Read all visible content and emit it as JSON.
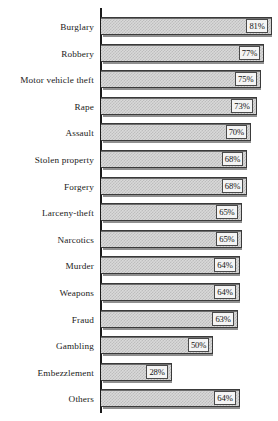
{
  "chart_data": {
    "type": "bar",
    "orientation": "horizontal",
    "title": "",
    "subtitle": "",
    "xlabel": "",
    "ylabel": "",
    "grid": false,
    "legend": null,
    "value_suffix": "%",
    "axis_visible": true,
    "xlim": [
      0,
      100
    ],
    "categories": [
      "Burglary",
      "Robbery",
      "Motor vehicle theft",
      "Rape",
      "Assault",
      "Stolen property",
      "Forgery",
      "Larceny-theft",
      "Narcotics",
      "Murder",
      "Weapons",
      "Fraud",
      "Gambling",
      "Embezzlement",
      "Others"
    ],
    "values": [
      81,
      77,
      75,
      73,
      70,
      68,
      68,
      65,
      65,
      64,
      64,
      63,
      50,
      28,
      64
    ],
    "data_labels": [
      "81%",
      "77%",
      "75%",
      "73%",
      "70%",
      "68%",
      "68%",
      "65%",
      "65%",
      "64%",
      "64%",
      "63%",
      "50%",
      "28%",
      "64%"
    ],
    "colors": {
      "bar_fill": "#d9d9d9",
      "bar_pattern": "#bdbdbd",
      "bar_border": "#3a3a3a",
      "axis": "#1b1b1b",
      "label_box_fill": "#f4f4f4",
      "label_box_border": "#4a4a4a",
      "text": "#1a1a1a",
      "background": "#ffffff"
    }
  }
}
